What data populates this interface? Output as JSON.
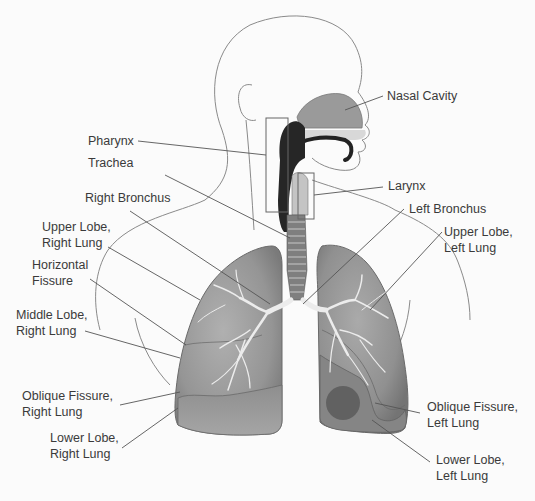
{
  "diagram": {
    "colors": {
      "background": "#fbfbfb",
      "outline": "#8a8a8a",
      "leader_line": "#555555",
      "lung_fill": "#9c9c9c",
      "lung_dark": "#6e6e6e",
      "airway_dark": "#222222",
      "nasal_fill": "#9a9a9a",
      "text": "#3a3a3a"
    },
    "labels": {
      "nasal_cavity": {
        "lines": [
          "Nasal Cavity"
        ]
      },
      "pharynx": {
        "lines": [
          "Pharynx"
        ]
      },
      "trachea": {
        "lines": [
          "Trachea"
        ]
      },
      "larynx": {
        "lines": [
          "Larynx"
        ]
      },
      "right_bronchus": {
        "lines": [
          "Right Bronchus"
        ]
      },
      "left_bronchus": {
        "lines": [
          "Left Bronchus"
        ]
      },
      "upper_lobe_right": {
        "lines": [
          "Upper Lobe,",
          "Right Lung"
        ]
      },
      "upper_lobe_left": {
        "lines": [
          "Upper Lobe,",
          "Left Lung"
        ]
      },
      "horizontal_fissure": {
        "lines": [
          "Horizontal",
          "Fissure"
        ]
      },
      "middle_lobe_right": {
        "lines": [
          "Middle Lobe,",
          "Right Lung"
        ]
      },
      "oblique_fissure_right": {
        "lines": [
          "Oblique Fissure,",
          "Right Lung"
        ]
      },
      "oblique_fissure_left": {
        "lines": [
          "Oblique Fissure,",
          "Left Lung"
        ]
      },
      "lower_lobe_right": {
        "lines": [
          "Lower Lobe,",
          "Right Lung"
        ]
      },
      "lower_lobe_left": {
        "lines": [
          "Lower Lobe,",
          "Left Lung"
        ]
      }
    }
  }
}
